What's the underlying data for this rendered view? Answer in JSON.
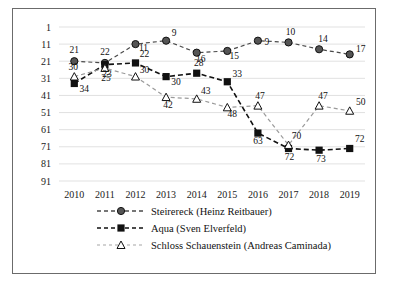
{
  "chart_data": {
    "type": "line",
    "title": "",
    "xlabel": "",
    "ylabel": "",
    "categories": [
      "2010",
      "2011",
      "2012",
      "2013",
      "2014",
      "2015",
      "2016",
      "2017",
      "2018",
      "2019"
    ],
    "x_tick_labels": [
      "2010",
      "2011",
      "2012",
      "2013",
      "2014",
      "2015",
      "2016",
      "2017",
      "2018",
      "2019"
    ],
    "y_tick_labels": [
      "1",
      "11",
      "21",
      "31",
      "41",
      "51",
      "61",
      "71",
      "81",
      "91"
    ],
    "y_ticks": [
      1,
      11,
      21,
      31,
      41,
      51,
      61,
      71,
      81,
      91
    ],
    "ylim": [
      1,
      91
    ],
    "y_axis_inverted": true,
    "grid": true,
    "grid_axis": "y",
    "legend_position": "bottom",
    "series": [
      {
        "name": "Steirereck (Heinz Reitbauer)",
        "marker": "filled-circle",
        "line_style": "dashed",
        "color": "#4a4a4a",
        "values": [
          21,
          22,
          11,
          9,
          16,
          15,
          9,
          10,
          14,
          17
        ],
        "data_labels": [
          "21",
          "22",
          "11",
          "9",
          "16",
          "15",
          "9",
          "10",
          "14",
          "17"
        ]
      },
      {
        "name": "Aqua (Sven Elverfeld)",
        "marker": "filled-square",
        "line_style": "dashed",
        "color": "#111111",
        "values": [
          34,
          23,
          22,
          30,
          28,
          33,
          63,
          72,
          73,
          72
        ],
        "data_labels": [
          "34",
          "23",
          "22",
          "30",
          "28",
          "33",
          "63",
          "72",
          "73",
          "72"
        ]
      },
      {
        "name": "Schloss Schauenstein (Andreas Caminada)",
        "marker": "hollow-triangle",
        "line_style": "dashed",
        "color": "#9a9a9a",
        "values": [
          30,
          25,
          30,
          42,
          43,
          48,
          47,
          70,
          47,
          50
        ],
        "data_labels": [
          "30",
          "25",
          "30",
          "42",
          "43",
          "48",
          "47",
          "70",
          "47",
          "50"
        ]
      }
    ]
  }
}
